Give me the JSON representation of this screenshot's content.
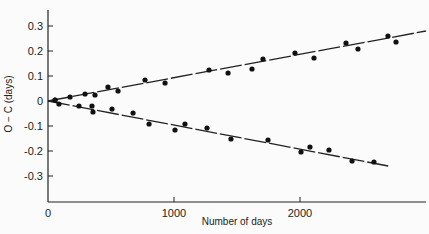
{
  "chart_data": {
    "type": "scatter",
    "title": "",
    "xlabel": "Number of days",
    "ylabel": "O − C (days)",
    "xlim": [
      0,
      3000
    ],
    "ylim": [
      -0.4,
      0.4
    ],
    "x_ticks": [
      0,
      1000,
      2000
    ],
    "x_tick_labels": [
      "0",
      "1000",
      "2000"
    ],
    "y_ticks": [
      0.3,
      0.2,
      0.1,
      0,
      -0.1,
      -0.2,
      -0.3
    ],
    "y_tick_labels": [
      "0.3",
      "0.2",
      "0.1",
      "0",
      "-0.1",
      "-0.2",
      "-0.3"
    ],
    "grid": false,
    "legend": null,
    "series": [
      {
        "name": "upper",
        "x": [
          56,
          175,
          294,
          373,
          476,
          556,
          770,
          929,
          1278,
          1429,
          1619,
          1706,
          1960,
          2111,
          2365,
          2460,
          2698,
          2762
        ],
        "y": [
          0.004,
          0.016,
          0.028,
          0.024,
          0.056,
          0.04,
          0.084,
          0.072,
          0.124,
          0.112,
          0.128,
          0.168,
          0.192,
          0.172,
          0.232,
          0.208,
          0.26,
          0.236
        ],
        "fit_line": {
          "x": [
            0,
            3000
          ],
          "y": [
            0.0,
            0.28
          ],
          "style": "dashed"
        }
      },
      {
        "name": "lower",
        "x": [
          56,
          87,
          246,
          349,
          357,
          508,
          675,
          802,
          1008,
          1087,
          1262,
          1452,
          1746,
          2008,
          2079,
          2230,
          2413,
          2587
        ],
        "y": [
          0.004,
          -0.012,
          -0.02,
          -0.02,
          -0.044,
          -0.032,
          -0.048,
          -0.092,
          -0.116,
          -0.092,
          -0.108,
          -0.152,
          -0.156,
          -0.204,
          -0.184,
          -0.196,
          -0.24,
          -0.244
        ],
        "fit_line": {
          "x": [
            0,
            2700
          ],
          "y": [
            0.0,
            -0.26
          ],
          "style": "dashed"
        }
      }
    ]
  },
  "layout": {
    "plot_left": 48,
    "plot_right": 426,
    "plot_top": 10,
    "plot_bottom": 202,
    "x_px_per_unit": 0.126,
    "y_zero_px": 101,
    "y_px_per_unit": 250
  }
}
